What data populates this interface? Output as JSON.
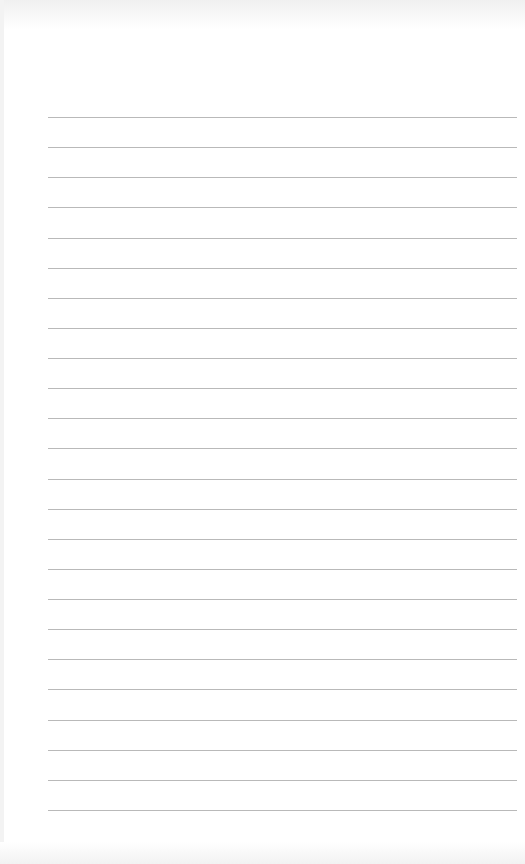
{
  "page": {
    "type": "lined-paper",
    "background_color": "#ffffff",
    "line_color": "#b9b9b9",
    "line_count": 24,
    "first_line_y": 117,
    "line_spacing": 30.13,
    "line_left_x": 48,
    "line_right_x": 517
  }
}
